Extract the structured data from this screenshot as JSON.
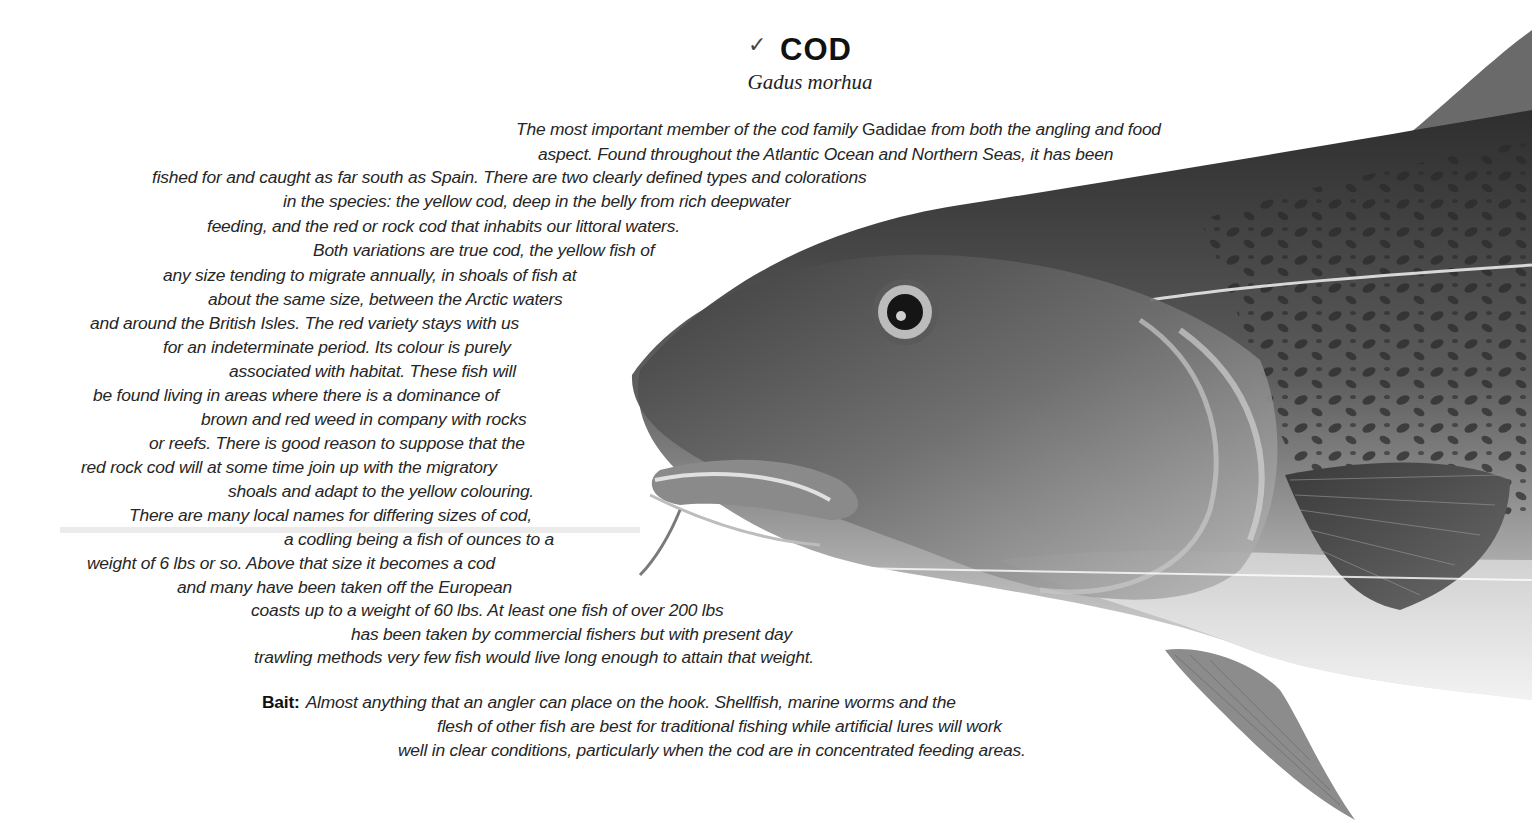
{
  "header": {
    "check_mark": "✓",
    "title": "COD",
    "latin_name": "Gadus morhua"
  },
  "description": {
    "lines": [
      {
        "before": "The most important member of the cod family ",
        "family": "Gadidae",
        "after": " from both the angling and food"
      },
      {
        "text": "aspect. Found throughout the Atlantic Ocean and Northern Seas, it has been"
      },
      {
        "text": "fished for and caught as far south as Spain. There are two clearly defined types and colorations"
      },
      {
        "text": "in the species: the yellow cod, deep in the belly from rich deepwater"
      },
      {
        "text": "feeding, and the red or rock cod that inhabits our littoral waters."
      },
      {
        "text": "Both variations are true cod, the yellow fish of"
      },
      {
        "text": "any size tending to migrate annually, in shoals of fish at"
      },
      {
        "text": "about the same size, between the Arctic waters"
      },
      {
        "text": "and around the British Isles. The red variety stays with us"
      },
      {
        "text": "for an indeterminate period. Its colour is purely"
      },
      {
        "text": "associated with habitat. These fish will"
      },
      {
        "text": "be found living in areas where there is a dominance of"
      },
      {
        "text": "brown and red weed in company with rocks"
      },
      {
        "text": "or reefs. There is good reason to suppose that the"
      },
      {
        "text": "red rock cod will at some time join up with the migratory"
      },
      {
        "text": "shoals and adapt to the yellow colouring."
      },
      {
        "text": "There are many local names for differing sizes of cod,"
      },
      {
        "text": "a codling being a fish of ounces to a"
      },
      {
        "text": "weight of 6 lbs or so. Above that size it becomes a cod"
      },
      {
        "text": "and many have been taken off the European"
      },
      {
        "text": "coasts up to a weight of 60 lbs. At least one fish of over 200 lbs"
      },
      {
        "text": "has been taken by commercial fishers but with present day"
      },
      {
        "text": "trawling methods very few fish would live long enough to attain that weight."
      }
    ]
  },
  "bait": {
    "label": "Bait:",
    "lines": [
      "Almost anything that an angler can place on the hook. Shellfish, marine worms and the",
      "flesh of other fish are best for traditional fishing while artificial lures will work",
      "well in clear conditions, particularly when the cod are in concentrated feeding areas."
    ]
  },
  "illustration": {
    "subject": "cod-head-illustration",
    "colors": {
      "body_dark": "#3a3a3a",
      "body_mid": "#6e6e6e",
      "belly": "#e6e6e6",
      "spots": "#2a2a2a"
    }
  }
}
